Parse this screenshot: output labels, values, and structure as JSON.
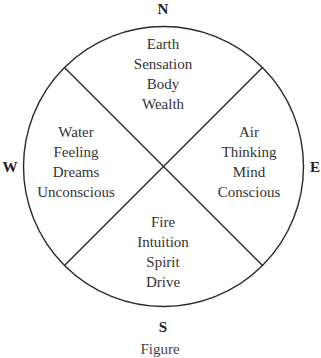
{
  "diagram": {
    "type": "compass-quadrant-wheel",
    "directions": {
      "north": "N",
      "south": "S",
      "east": "E",
      "west": "W"
    },
    "quadrants": {
      "north": [
        "Earth",
        "Sensation",
        "Body",
        "Wealth"
      ],
      "west": [
        "Water",
        "Feeling",
        "Dreams",
        "Unconscious"
      ],
      "east": [
        "Air",
        "Thinking",
        "Mind",
        "Conscious"
      ],
      "south": [
        "Fire",
        "Intuition",
        "Spirit",
        "Drive"
      ]
    },
    "caption": "Figure"
  }
}
